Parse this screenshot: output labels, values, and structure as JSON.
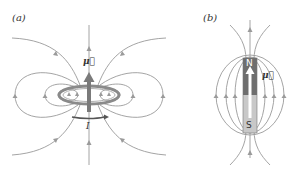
{
  "panels": [
    {
      "id": "a",
      "label": "(a)",
      "description": "Magnetic field lines of a current loop",
      "moment_label": "μ⃗",
      "current_label": "I",
      "colors": {
        "field_lines": "#9a9a9a",
        "loop": "#8a8a8a",
        "moment_arrow": "#7a7a7a",
        "current_arrow": "#555555"
      }
    },
    {
      "id": "b",
      "label": "(b)",
      "description": "Magnetic field lines of a bar magnet",
      "north_label": "N",
      "south_label": "S",
      "moment_label": "μ⃗",
      "colors": {
        "field_lines": "#9a9a9a",
        "north_half": "#6e6e6e",
        "south_half": "#c8c8c8"
      }
    }
  ]
}
